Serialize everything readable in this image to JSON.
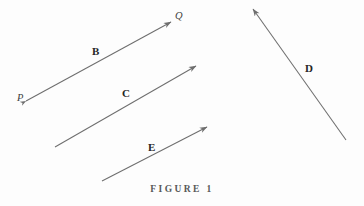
{
  "figure": {
    "caption": "FIGURE  1",
    "background_color": "#fdfdfd",
    "stroke_color": "#6e6e6e",
    "label_color": "#262626",
    "width": 364,
    "height": 206
  },
  "labels": {
    "vector_b": "B",
    "vector_c": "C",
    "vector_d": "D",
    "vector_e": "E",
    "point_p": "P",
    "point_q": "Q"
  },
  "chart_data": {
    "type": "diagram",
    "title": "FIGURE  1",
    "xlabel": "",
    "ylabel": "",
    "xlim": [
      0,
      364
    ],
    "ylim": [
      206,
      0
    ],
    "grid": false,
    "legend": "none",
    "arrows": [
      {
        "name": "B",
        "label": "B",
        "tail": [
          26,
          101
        ],
        "head": [
          171,
          22
        ],
        "double_headed": true,
        "tail_head_label": "P",
        "head_label": "Q",
        "direction_deg": 28.6,
        "length_px": 165
      },
      {
        "name": "C",
        "label": "C",
        "tail": [
          55,
          147
        ],
        "head": [
          196,
          66
        ],
        "double_headed": false,
        "direction_deg": 29.9,
        "length_px": 163
      },
      {
        "name": "D",
        "label": "D",
        "tail": [
          346,
          140
        ],
        "head": [
          253,
          9
        ],
        "double_headed": false,
        "direction_deg": 125.4,
        "length_px": 161
      },
      {
        "name": "E",
        "label": "E",
        "tail": [
          102,
          181
        ],
        "head": [
          207,
          127
        ],
        "double_headed": false,
        "direction_deg": 27.2,
        "length_px": 118
      }
    ],
    "points": [
      {
        "name": "P",
        "label": "P",
        "at": [
          26,
          101
        ]
      },
      {
        "name": "Q",
        "label": "Q",
        "at": [
          171,
          22
        ]
      }
    ]
  }
}
